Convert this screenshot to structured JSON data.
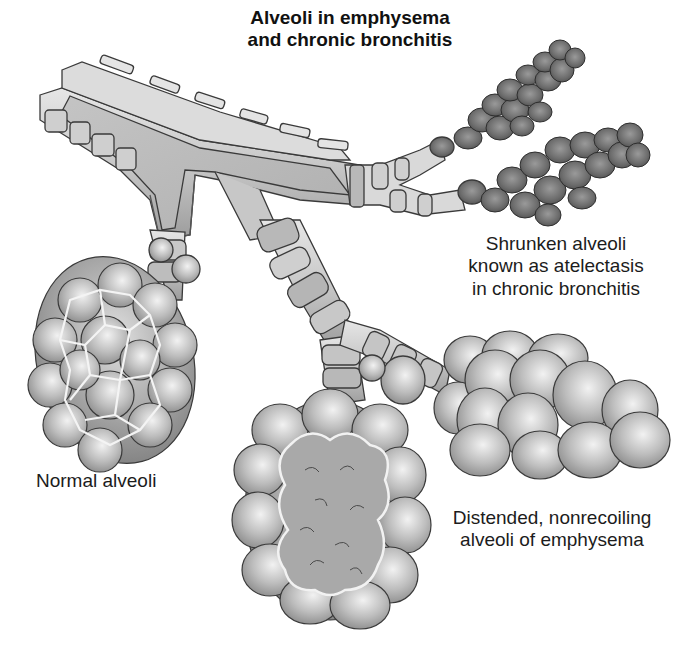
{
  "diagram": {
    "title_lines": [
      "Alveoli in emphysema",
      "and chronic bronchitis"
    ],
    "labels": {
      "atelectasis": [
        "Shrunken alveoli",
        "known as atelectasis",
        "in chronic bronchitis"
      ],
      "normal": [
        "Normal alveoli"
      ],
      "emphysema": [
        "Distended, nonrecoiling",
        "alveoli of emphysema"
      ]
    },
    "structures": [
      {
        "id": "bronchus",
        "description": "Cut-open main bronchiole with cartilage rings"
      },
      {
        "id": "normal-alveoli-cluster",
        "description": "Cluster of normal alveoli with septal walls"
      },
      {
        "id": "emphysema-alveoli-cluster",
        "description": "Distended alveolar sac with destroyed septa"
      },
      {
        "id": "distended-alveoli-cluster",
        "description": "Enlarged round alveoli"
      },
      {
        "id": "atelectasis-clusters",
        "description": "Two clusters of small dark shrunken alveoli"
      }
    ],
    "colors": {
      "background": "#ffffff",
      "tissue_light": "#d6d6d6",
      "tissue_mid": "#a8a8a8",
      "tissue_dark": "#6e6e6e",
      "outline": "#3a3a3a",
      "text": "#1c1c1c"
    }
  }
}
